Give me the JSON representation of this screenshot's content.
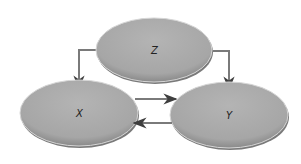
{
  "diagram": {
    "type": "causal-graph",
    "nodes": [
      {
        "id": "Z",
        "label": "Z",
        "cx": 154,
        "cy": 50,
        "rx": 58,
        "ry": 32
      },
      {
        "id": "X",
        "label": "X",
        "cx": 79,
        "cy": 113,
        "rx": 59,
        "ry": 33
      },
      {
        "id": "Y",
        "label": "Y",
        "cx": 229,
        "cy": 115,
        "rx": 59,
        "ry": 33
      }
    ],
    "edges": [
      {
        "from": "Z",
        "to": "X"
      },
      {
        "from": "Z",
        "to": "Y"
      },
      {
        "from": "X",
        "to": "Y"
      },
      {
        "from": "Y",
        "to": "X"
      }
    ],
    "colors": {
      "node_fill": "#a9a9a9",
      "node_edge": "#6f6f6f",
      "node_highlight": "#d8d8d8",
      "line": "#7a7a7a",
      "arrow": "#444444",
      "label": "#222222"
    }
  }
}
